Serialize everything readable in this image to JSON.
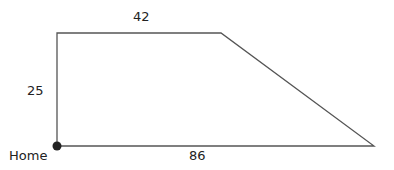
{
  "diagram": {
    "shape": "trapezoid",
    "colors": {
      "stroke": "#555555",
      "dot": "#222222",
      "text": "#222222"
    },
    "labels": {
      "top": "42",
      "left": "25",
      "bottom": "86",
      "home": "Home"
    }
  }
}
